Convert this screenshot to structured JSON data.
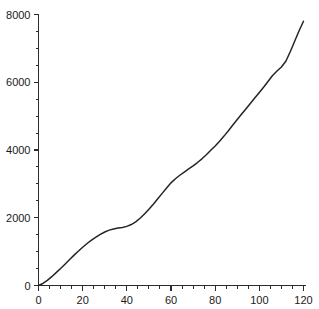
{
  "chart_data": {
    "type": "line",
    "title": "",
    "subtitle": "",
    "xlabel": "",
    "ylabel": "",
    "xlim": [
      0,
      120
    ],
    "ylim": [
      0,
      8000
    ],
    "grid": false,
    "legend": null,
    "legend_position": "none",
    "line_color": "#252525",
    "background_color": "#ffffff",
    "axis_color": "#2b2b2b",
    "x_major_ticks": [
      0,
      20,
      40,
      60,
      80,
      100,
      120
    ],
    "x_major_tick_labels": [
      "0",
      "20",
      "40",
      "60",
      "80",
      "100",
      "120"
    ],
    "x_minor_tick_interval": 5,
    "y_major_ticks": [
      0,
      2000,
      4000,
      6000,
      8000
    ],
    "y_major_tick_labels": [
      "0",
      "2000",
      "4000",
      "6000",
      "8000"
    ],
    "y_minor_tick_interval": 500,
    "series": [
      {
        "name": "series-1",
        "x": [
          0,
          2,
          4,
          6,
          8,
          10,
          12,
          14,
          16,
          18,
          20,
          22,
          24,
          26,
          28,
          30,
          32,
          34,
          36,
          38,
          40,
          42,
          44,
          46,
          48,
          50,
          52,
          54,
          56,
          58,
          60,
          62,
          64,
          66,
          68,
          70,
          72,
          74,
          76,
          78,
          80,
          82,
          84,
          86,
          88,
          90,
          92,
          94,
          96,
          98,
          100,
          102,
          104,
          106,
          108,
          110,
          112,
          114,
          116,
          118,
          120
        ],
        "values": [
          0,
          60,
          150,
          260,
          380,
          500,
          630,
          760,
          890,
          1010,
          1130,
          1240,
          1340,
          1430,
          1510,
          1580,
          1635,
          1670,
          1695,
          1715,
          1745,
          1800,
          1880,
          1985,
          2110,
          2250,
          2400,
          2560,
          2720,
          2880,
          3030,
          3150,
          3255,
          3350,
          3440,
          3530,
          3630,
          3740,
          3860,
          3990,
          4120,
          4260,
          4410,
          4570,
          4740,
          4900,
          5060,
          5220,
          5380,
          5540,
          5700,
          5860,
          6030,
          6200,
          6330,
          6450,
          6620,
          6900,
          7210,
          7520,
          7800
        ]
      }
    ]
  },
  "axes": {
    "x_labels": [
      "0",
      "20",
      "40",
      "60",
      "80",
      "100",
      "120"
    ],
    "y_labels": [
      "0",
      "2000",
      "4000",
      "6000",
      "8000"
    ]
  }
}
